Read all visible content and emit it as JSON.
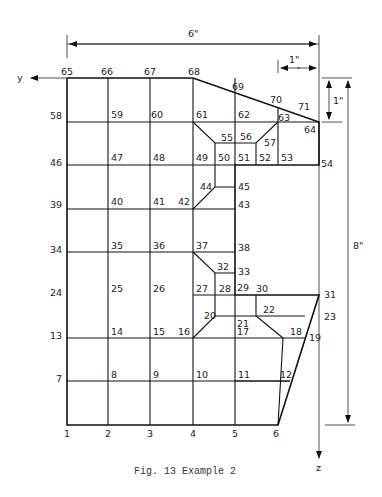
{
  "figure": {
    "caption": "Fig. 13  Example 2",
    "axes": {
      "y_label": "y",
      "z_label": "z"
    },
    "dimensions": {
      "width_total": "6\"",
      "right_offset": "1\"",
      "top_offset": "1\"",
      "height_total": "8\""
    },
    "nodes": {
      "n1": "1",
      "n2": "2",
      "n3": "3",
      "n4": "4",
      "n5": "5",
      "n6": "6",
      "n7": "7",
      "n8": "8",
      "n9": "9",
      "n10": "10",
      "n11": "11",
      "n12": "12",
      "n13": "13",
      "n14": "14",
      "n15": "15",
      "n16": "16",
      "n17": "17",
      "n18": "18",
      "n19": "19",
      "n20": "20",
      "n21": "21",
      "n22": "22",
      "n23": "23",
      "n24": "24",
      "n25": "25",
      "n26": "26",
      "n27": "27",
      "n28": "28",
      "n29": "29",
      "n30": "30",
      "n31": "31",
      "n32": "32",
      "n33": "33",
      "n34": "34",
      "n35": "35",
      "n36": "36",
      "n37": "37",
      "n38": "38",
      "n39": "39",
      "n40": "40",
      "n41": "41",
      "n42": "42",
      "n43": "43",
      "n44": "44",
      "n45": "45",
      "n46": "46",
      "n47": "47",
      "n48": "48",
      "n49": "49",
      "n50": "50",
      "n51": "51",
      "n52": "52",
      "n53": "53",
      "n54": "54",
      "n55": "55",
      "n56": "56",
      "n57": "57",
      "n58": "58",
      "n59": "59",
      "n60": "60",
      "n61": "61",
      "n62": "62",
      "n63": "63",
      "n64": "64",
      "n65": "65",
      "n66": "66",
      "n67": "67",
      "n68": "68",
      "n69": "69",
      "n70": "70",
      "n71": "71"
    }
  }
}
